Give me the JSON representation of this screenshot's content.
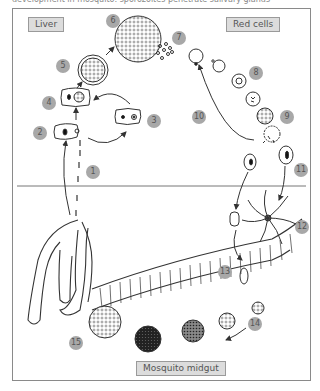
{
  "caption": "development in mosquito: sporozoites penetrate salivary glands",
  "regions": {
    "liver": "Liver",
    "red_cells": "Red cells",
    "mosquito_midgut": "Mosquito midgut"
  },
  "stages": [
    {
      "n": "1",
      "x": 86,
      "y": 165
    },
    {
      "n": "2",
      "x": 33,
      "y": 132
    },
    {
      "n": "3",
      "x": 148,
      "y": 118
    },
    {
      "n": "4",
      "x": 43,
      "y": 96
    },
    {
      "n": "5",
      "x": 56,
      "y": 59
    },
    {
      "n": "6",
      "x": 106,
      "y": 14
    },
    {
      "n": "7",
      "x": 172,
      "y": 28
    },
    {
      "n": "8",
      "x": 250,
      "y": 70
    },
    {
      "n": "9",
      "x": 281,
      "y": 113
    },
    {
      "n": "10",
      "x": 192,
      "y": 113
    },
    {
      "n": "11",
      "x": 295,
      "y": 165
    },
    {
      "n": "12",
      "x": 296,
      "y": 222
    },
    {
      "n": "13",
      "x": 218,
      "y": 267
    },
    {
      "n": "14",
      "x": 247,
      "y": 318
    },
    {
      "n": "15",
      "x": 69,
      "y": 336
    }
  ],
  "colors": {
    "line": "#333333",
    "badge": "#a8a8a8",
    "label_bg": "#dcdcdc",
    "frame": "#8a8a8a"
  }
}
